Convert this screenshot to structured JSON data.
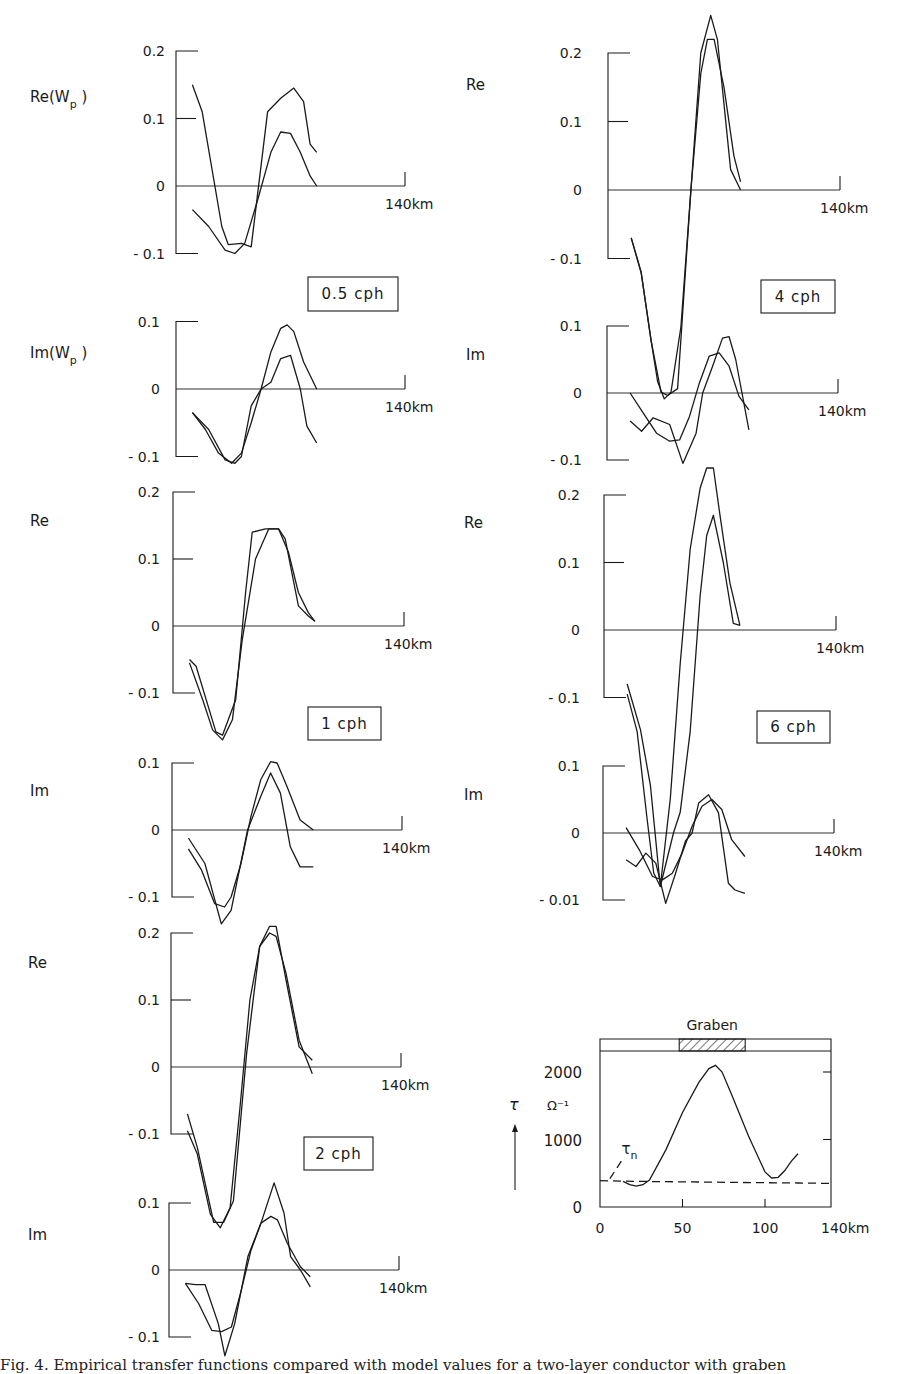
{
  "figure": {
    "caption": "Fig. 4. Empirical transfer functions compared with model values for a two-layer conductor with graben",
    "x_end_label": "140km",
    "x_range_km": [
      0,
      140
    ],
    "line_color": "#1a1a1a"
  },
  "chart_data": [
    {
      "type": "line",
      "id": "re-0.5cph",
      "title": "0.5 cph",
      "ylabel": "Re(W_p)",
      "xlabel": "km",
      "yticks": [
        0.2,
        0.1,
        0,
        -0.1
      ],
      "ytick_labels": [
        "0.2",
        "0.1",
        "0",
        "- 0.1"
      ],
      "ylim": [
        -0.1,
        0.2
      ],
      "xlim": [
        0,
        140
      ],
      "x_end_label": "140km",
      "series": [
        {
          "name": "observed",
          "x": [
            10,
            16,
            28,
            32,
            40,
            46,
            56,
            64,
            72,
            78,
            82,
            86
          ],
          "y": [
            0.15,
            0.11,
            -0.06,
            -0.087,
            -0.085,
            -0.09,
            0.11,
            0.13,
            0.145,
            0.125,
            0.062,
            0.05
          ]
        },
        {
          "name": "model",
          "x": [
            10,
            20,
            30,
            36,
            42,
            50,
            58,
            64,
            70,
            76,
            82,
            86
          ],
          "y": [
            -0.035,
            -0.06,
            -0.095,
            -0.1,
            -0.085,
            -0.02,
            0.05,
            0.08,
            0.078,
            0.05,
            0.015,
            0.0
          ]
        }
      ]
    },
    {
      "type": "line",
      "id": "im-0.5cph",
      "title": "0.5 cph",
      "ylabel": "Im(W_p)",
      "yticks": [
        0.1,
        0,
        -0.1
      ],
      "ytick_labels": [
        "0.1",
        "0",
        "- 0.1"
      ],
      "ylim": [
        -0.1,
        0.1
      ],
      "xlim": [
        0,
        140
      ],
      "x_end_label": "140km",
      "series": [
        {
          "name": "observed",
          "x": [
            10,
            20,
            30,
            36,
            40,
            46,
            52,
            58,
            64,
            70,
            76,
            80,
            86
          ],
          "y": [
            -0.035,
            -0.06,
            -0.105,
            -0.11,
            -0.1,
            -0.025,
            0.0,
            0.01,
            0.045,
            0.05,
            0.0,
            -0.055,
            -0.08
          ]
        },
        {
          "name": "model",
          "x": [
            10,
            18,
            26,
            34,
            40,
            46,
            52,
            58,
            64,
            68,
            72,
            78,
            86
          ],
          "y": [
            -0.035,
            -0.06,
            -0.095,
            -0.11,
            -0.095,
            -0.05,
            0.0,
            0.055,
            0.09,
            0.095,
            0.085,
            0.04,
            0.0
          ]
        }
      ]
    },
    {
      "type": "line",
      "id": "re-1cph",
      "title": "1 cph",
      "ylabel": "Re",
      "yticks": [
        0.2,
        0.1,
        0,
        -0.1
      ],
      "ytick_labels": [
        "0.2",
        "0.1",
        "0",
        "- 0.1"
      ],
      "ylim": [
        -0.1,
        0.2
      ],
      "xlim": [
        0,
        140
      ],
      "x_end_label": "140km",
      "series": [
        {
          "name": "observed",
          "x": [
            10,
            14,
            26,
            30,
            38,
            44,
            48,
            56,
            64,
            68,
            76,
            82,
            86
          ],
          "y": [
            -0.05,
            -0.06,
            -0.158,
            -0.163,
            -0.11,
            0.05,
            0.14,
            0.145,
            0.145,
            0.13,
            0.03,
            0.015,
            0.007
          ]
        },
        {
          "name": "model",
          "x": [
            10,
            18,
            24,
            30,
            36,
            42,
            50,
            58,
            64,
            70,
            76,
            82,
            86
          ],
          "y": [
            -0.055,
            -0.11,
            -0.155,
            -0.17,
            -0.14,
            -0.02,
            0.1,
            0.145,
            0.145,
            0.11,
            0.05,
            0.02,
            0.007
          ]
        }
      ]
    },
    {
      "type": "line",
      "id": "im-1cph",
      "title": "1 cph",
      "ylabel": "Im",
      "yticks": [
        0.1,
        0,
        -0.1
      ],
      "ytick_labels": [
        "0.1",
        "0",
        "- 0.1"
      ],
      "ylim": [
        -0.1,
        0.1
      ],
      "xlim": [
        0,
        140
      ],
      "x_end_label": "140km",
      "series": [
        {
          "name": "observed",
          "x": [
            10,
            20,
            30,
            36,
            46,
            54,
            60,
            66,
            72,
            78,
            86
          ],
          "y": [
            -0.012,
            -0.05,
            -0.14,
            -0.12,
            0.0,
            0.05,
            0.085,
            0.055,
            -0.025,
            -0.055,
            -0.055
          ]
        },
        {
          "name": "model",
          "x": [
            10,
            18,
            26,
            32,
            36,
            42,
            48,
            54,
            60,
            64,
            70,
            78,
            86
          ],
          "y": [
            -0.028,
            -0.06,
            -0.11,
            -0.115,
            -0.1,
            -0.05,
            0.02,
            0.075,
            0.102,
            0.1,
            0.065,
            0.015,
            -0.0
          ]
        }
      ]
    },
    {
      "type": "line",
      "id": "re-2cph",
      "title": "2 cph",
      "ylabel": "Re",
      "yticks": [
        0.2,
        0.1,
        0,
        -0.1
      ],
      "ytick_labels": [
        "0.2",
        "0.1",
        "0",
        "- 0.1"
      ],
      "ylim": [
        -0.1,
        0.2
      ],
      "xlim": [
        0,
        140
      ],
      "x_end_label": "140km",
      "series": [
        {
          "name": "observed",
          "x": [
            10,
            16,
            26,
            32,
            38,
            46,
            54,
            60,
            64,
            70,
            78,
            86
          ],
          "y": [
            -0.07,
            -0.12,
            -0.232,
            -0.232,
            -0.2,
            0.02,
            0.18,
            0.21,
            0.21,
            0.13,
            0.03,
            0.01
          ]
        },
        {
          "name": "model",
          "x": [
            10,
            16,
            24,
            30,
            36,
            42,
            48,
            54,
            60,
            64,
            70,
            78,
            86
          ],
          "y": [
            -0.095,
            -0.13,
            -0.22,
            -0.24,
            -0.21,
            -0.06,
            0.1,
            0.18,
            0.2,
            0.195,
            0.14,
            0.04,
            -0.01
          ]
        }
      ]
    },
    {
      "type": "line",
      "id": "im-2cph",
      "title": "2 cph",
      "ylabel": "Im",
      "yticks": [
        0.1,
        0,
        -0.1
      ],
      "ytick_labels": [
        "0.1",
        "0",
        "- 0.1"
      ],
      "ylim": [
        -0.1,
        0.1
      ],
      "xlim": [
        0,
        140
      ],
      "x_end_label": "140km",
      "series": [
        {
          "name": "observed",
          "x": [
            10,
            16,
            22,
            30,
            34,
            40,
            48,
            56,
            64,
            70,
            74,
            80,
            86
          ],
          "y": [
            -0.02,
            -0.022,
            -0.022,
            -0.08,
            -0.128,
            -0.08,
            0.02,
            0.07,
            0.13,
            0.085,
            0.02,
            0.0,
            -0.025
          ]
        },
        {
          "name": "model",
          "x": [
            10,
            18,
            26,
            32,
            38,
            44,
            50,
            56,
            62,
            66,
            72,
            80,
            86
          ],
          "y": [
            -0.02,
            -0.05,
            -0.09,
            -0.092,
            -0.085,
            -0.03,
            0.03,
            0.07,
            0.08,
            0.075,
            0.04,
            0.005,
            -0.01
          ]
        }
      ]
    },
    {
      "type": "line",
      "id": "re-4cph",
      "title": "4 cph",
      "ylabel": "Re",
      "yticks": [
        0.2,
        0.1,
        0,
        -0.1
      ],
      "ytick_labels": [
        "0.2",
        "0.1",
        "0",
        "- 0.1"
      ],
      "ylim": [
        -0.1,
        0.2
      ],
      "xlim": [
        0,
        140
      ],
      "x_end_label": "140km",
      "series": [
        {
          "name": "observed",
          "x": [
            14,
            20,
            26,
            32,
            36,
            42,
            50,
            56,
            62,
            66,
            74,
            78,
            80
          ],
          "y": [
            -0.07,
            -0.12,
            -0.22,
            -0.295,
            -0.3,
            -0.29,
            0.0,
            0.2,
            0.255,
            0.22,
            0.03,
            0.01,
            0.0
          ]
        },
        {
          "name": "model",
          "x": [
            14,
            20,
            26,
            30,
            34,
            38,
            44,
            50,
            56,
            60,
            64,
            70,
            76,
            80
          ],
          "y": [
            -0.07,
            -0.12,
            -0.22,
            -0.28,
            -0.305,
            -0.295,
            -0.2,
            0.0,
            0.17,
            0.22,
            0.22,
            0.15,
            0.05,
            0.012
          ]
        }
      ]
    },
    {
      "type": "line",
      "id": "im-4cph",
      "title": "4 cph",
      "ylabel": "Im",
      "yticks": [
        0.1,
        0,
        -0.1
      ],
      "ytick_labels": [
        "0.1",
        "0",
        "- 0.1"
      ],
      "ylim": [
        -0.1,
        0.1
      ],
      "xlim": [
        0,
        140
      ],
      "x_end_label": "140km",
      "series": [
        {
          "name": "observed",
          "x": [
            14,
            21,
            28,
            38,
            46,
            54,
            58,
            64,
            70,
            74,
            78,
            86
          ],
          "y": [
            -0.042,
            -0.057,
            -0.037,
            -0.047,
            -0.105,
            -0.06,
            0.0,
            0.04,
            0.082,
            0.084,
            0.05,
            -0.055
          ]
        },
        {
          "name": "model",
          "x": [
            14,
            22,
            30,
            38,
            44,
            50,
            56,
            62,
            68,
            74,
            80,
            86
          ],
          "y": [
            -0.0,
            -0.03,
            -0.06,
            -0.072,
            -0.07,
            -0.035,
            0.015,
            0.055,
            0.06,
            0.04,
            -0.005,
            -0.025
          ]
        }
      ]
    },
    {
      "type": "line",
      "id": "re-6cph",
      "title": "6 cph",
      "ylabel": "Re",
      "yticks": [
        0.2,
        0.1,
        0,
        -0.1
      ],
      "ytick_labels": [
        "0.2",
        "0.1",
        "0",
        "- 0.1"
      ],
      "ylim": [
        -0.1,
        0.2
      ],
      "xlim": [
        0,
        140
      ],
      "x_end_label": "140km",
      "series": [
        {
          "name": "observed",
          "x": [
            14,
            22,
            28,
            34,
            42,
            46,
            52,
            58,
            62,
            66,
            72,
            78,
            82
          ],
          "y": [
            -0.08,
            -0.148,
            -0.23,
            -0.38,
            -0.3,
            -0.27,
            -0.15,
            0.05,
            0.14,
            0.17,
            0.1,
            0.01,
            0.007
          ]
        },
        {
          "name": "model",
          "x": [
            14,
            20,
            26,
            30,
            34,
            40,
            46,
            52,
            58,
            62,
            66,
            70,
            76,
            82
          ],
          "y": [
            -0.095,
            -0.15,
            -0.28,
            -0.36,
            -0.38,
            -0.25,
            -0.05,
            0.12,
            0.21,
            0.24,
            0.24,
            0.17,
            0.07,
            0.007
          ]
        }
      ]
    },
    {
      "type": "line",
      "id": "im-6cph",
      "title": "6 cph",
      "ylabel": "Im",
      "yticks": [
        0.1,
        0,
        -0.1
      ],
      "ytick_labels": [
        "0.1",
        "0",
        "- 0.01"
      ],
      "ylim": [
        -0.1,
        0.1
      ],
      "xlim": [
        0,
        140
      ],
      "x_end_label": "140km",
      "series": [
        {
          "name": "observed",
          "x": [
            14,
            20,
            26,
            32,
            38,
            44,
            50,
            54,
            58,
            64,
            70,
            76,
            80,
            86
          ],
          "y": [
            -0.04,
            -0.05,
            -0.03,
            -0.045,
            -0.105,
            -0.06,
            -0.012,
            0.0,
            0.045,
            0.057,
            0.03,
            -0.075,
            -0.085,
            -0.09
          ]
        },
        {
          "name": "model",
          "x": [
            14,
            22,
            30,
            36,
            42,
            48,
            54,
            60,
            66,
            72,
            78,
            86
          ],
          "y": [
            0.008,
            -0.025,
            -0.065,
            -0.07,
            -0.06,
            -0.03,
            0.01,
            0.04,
            0.05,
            0.035,
            -0.01,
            -0.035
          ]
        }
      ]
    },
    {
      "type": "line",
      "id": "tau-profile",
      "title": "Graben",
      "ylabel": "τ",
      "yunit": "Ω⁻¹",
      "xlabel": "km",
      "xticks": [
        0,
        50,
        100,
        140
      ],
      "xtick_labels": [
        "0",
        "50",
        "100",
        "140km"
      ],
      "yticks": [
        0,
        1000,
        2000
      ],
      "ytick_labels": [
        "0",
        "1000",
        "2000"
      ],
      "xlim": [
        0,
        140
      ],
      "ylim": [
        0,
        2500
      ],
      "graben_extent_km": [
        48,
        88
      ],
      "series": [
        {
          "name": "τ",
          "style": "solid",
          "x": [
            14,
            18,
            22,
            26,
            30,
            40,
            50,
            60,
            66,
            70,
            74,
            80,
            90,
            100,
            104,
            108,
            112,
            116,
            120
          ],
          "y": [
            380,
            330,
            310,
            330,
            400,
            850,
            1400,
            1850,
            2050,
            2100,
            2000,
            1650,
            1050,
            520,
            430,
            440,
            540,
            680,
            790
          ]
        },
        {
          "name": "τn",
          "style": "dashed",
          "x": [
            0,
            20,
            40,
            60,
            80,
            100,
            120,
            140
          ],
          "y": [
            390,
            380,
            375,
            370,
            365,
            360,
            355,
            350
          ]
        },
        {
          "name": "τn-leader",
          "style": "dashed",
          "x": [
            6,
            14
          ],
          "y": [
            420,
            720
          ]
        }
      ],
      "annotations": [
        {
          "text": "τ",
          "sub": "n",
          "x": 13,
          "y": 780
        }
      ]
    }
  ]
}
